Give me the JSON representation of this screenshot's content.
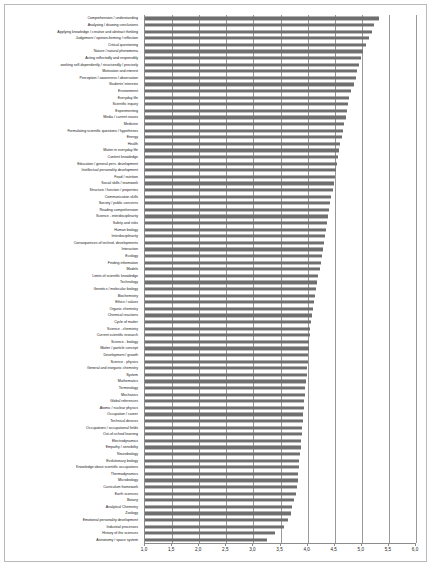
{
  "chart_data": {
    "type": "bar",
    "orientation": "horizontal",
    "title": "",
    "subtitle": "",
    "xlabel": "",
    "ylabel": "",
    "xlim": [
      1.0,
      6.0
    ],
    "xticks": [
      "1,0",
      "1,5",
      "2,0",
      "2,5",
      "3,0",
      "3,5",
      "4,0",
      "4,5",
      "5,0",
      "5,5",
      "6,0"
    ],
    "xtick_values": [
      1.0,
      1.5,
      2.0,
      2.5,
      3.0,
      3.5,
      4.0,
      4.5,
      5.0,
      5.5,
      6.0
    ],
    "grid": true,
    "grid_axis": "x",
    "legend": "none",
    "bar_color": "#6f6f6f",
    "categories": [
      "Comprehension / understanding",
      "Analysing / drawing conclusions",
      "Applying knowledge / creative and abstract thinking",
      "Judgement / opinion-forming / reflection",
      "Critical questioning",
      "Nature / natural phenomena",
      "Acting reflectedly and responsibly",
      "working self-dependently / structuredly / precisely",
      "Motivation and interest",
      "Perception / awareness / observation",
      "Students' interests",
      "Environment",
      "Everyday life",
      "Scientific inquiry",
      "Experimenting",
      "Media / current issues",
      "Medicine",
      "Formulating scientific questions / hypotheses",
      "Energy",
      "Health",
      "Matter in everyday life",
      "Content knowledge",
      "Education / general pers. development",
      "Intellectual personality development",
      "Food / nutrition",
      "Social skills / teamwork",
      "Structure / function / properties",
      "Communication skills",
      "Society / public concerns",
      "Reading comprehension",
      "Science - interdisciplinarity",
      "Safety and risks",
      "Human biology",
      "Interdisciplinarity",
      "Consequences of technol. developments",
      "Interaction",
      "Ecology",
      "Finding information",
      "Models",
      "Limits of scientific knowledge",
      "Technology",
      "Genetics / molecular biology",
      "Biochemistry",
      "Ethics / values",
      "Organic chemistry",
      "Chemical reactions",
      "Cycle of matter",
      "Science - chemistry",
      "Current scientific research",
      "Science - biology",
      "Matter / particle concept",
      "Development / growth",
      "Science - physics",
      "General and inorganic chemistry",
      "System",
      "Mathematics",
      "Terminology",
      "Mechanics",
      "Global references",
      "Atomic / nuclear physics",
      "Occupation / career",
      "Technical devices",
      "Occupations / occupational fields",
      "Out-of-school learning",
      "Electrodynamics",
      "Empathy / sensibility",
      "Neurobiology",
      "Evolutionary biology",
      "Knowledge about scientific occupations",
      "Thermodynamics",
      "Microbiology",
      "Curriculum framework",
      "Earth sciences",
      "Botany",
      "Analytical Chemistry",
      "Zoology",
      "Emotional personality development",
      "Industrial processes",
      "History of the sciences",
      "Astronomy / space system"
    ],
    "values": [
      5.32,
      5.22,
      5.18,
      5.14,
      5.07,
      5.02,
      4.98,
      4.95,
      4.92,
      4.9,
      4.85,
      4.8,
      4.77,
      4.75,
      4.73,
      4.71,
      4.68,
      4.66,
      4.63,
      4.6,
      4.58,
      4.56,
      4.54,
      4.52,
      4.5,
      4.48,
      4.46,
      4.44,
      4.42,
      4.4,
      4.38,
      4.36,
      4.34,
      4.32,
      4.3,
      4.28,
      4.26,
      4.24,
      4.22,
      4.2,
      4.18,
      4.16,
      4.14,
      4.12,
      4.1,
      4.08,
      4.06,
      4.05,
      4.04,
      4.03,
      4.02,
      4.01,
      4.0,
      3.99,
      3.98,
      3.97,
      3.96,
      3.95,
      3.94,
      3.93,
      3.92,
      3.91,
      3.9,
      3.89,
      3.88,
      3.87,
      3.86,
      3.85,
      3.84,
      3.83,
      3.82,
      3.8,
      3.78,
      3.74,
      3.72,
      3.7,
      3.64,
      3.57,
      3.4,
      3.25
    ]
  }
}
